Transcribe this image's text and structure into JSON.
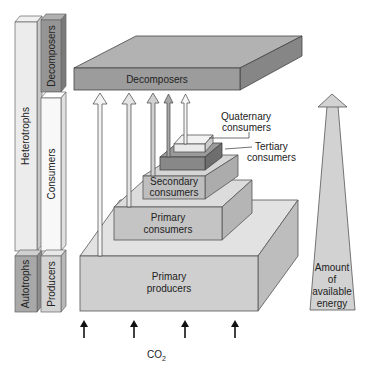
{
  "diagram": {
    "side_columns": {
      "outer": [
        {
          "label": "Heterotrophs"
        },
        {
          "label": "Autotrophs"
        }
      ],
      "inner": [
        {
          "label": "Decomposers"
        },
        {
          "label": "Consumers"
        },
        {
          "label": "Producers"
        }
      ]
    },
    "levels": {
      "decomposers": "Decomposers",
      "quaternary_1": "Quaternary",
      "quaternary_2": "consumers",
      "tertiary_1": "Tertiary",
      "tertiary_2": "consumers",
      "secondary_1": "Secondary",
      "secondary_2": "consumers",
      "primary_consumers_1": "Primary",
      "primary_consumers_2": "consumers",
      "primary_producers_1": "Primary",
      "primary_producers_2": "producers"
    },
    "energy_arrow": {
      "line1": "Amount",
      "line2": "of",
      "line3": "available",
      "line4": "energy"
    },
    "co2": {
      "base": "CO",
      "subscript": "2"
    },
    "colors": {
      "light": "#e6e6e6",
      "mid": "#c8c8c8",
      "dark": "#9a9a9a",
      "darker": "#7a7a7a",
      "outline": "#555555"
    }
  }
}
